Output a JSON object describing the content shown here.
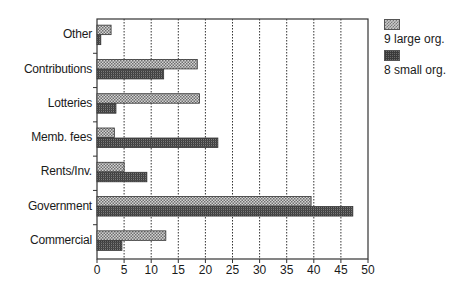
{
  "chart_data": {
    "type": "bar",
    "orientation": "horizontal",
    "title": "",
    "xlabel": "",
    "ylabel": "",
    "xlim": [
      0,
      50
    ],
    "xticks": [
      0,
      5,
      10,
      15,
      20,
      25,
      30,
      35,
      40,
      45,
      50
    ],
    "grid": "vertical dotted",
    "legend_position": "right",
    "categories": [
      "Other",
      "Contributions",
      "Lotteries",
      "Memb. fees",
      "Rents/Inv.",
      "Government",
      "Commercial"
    ],
    "series": [
      {
        "name": "9 large org.",
        "pattern": "checkered-light",
        "values": [
          2.6,
          18.5,
          18.9,
          3.2,
          5.0,
          39.5,
          12.7
        ]
      },
      {
        "name": "8 small org.",
        "pattern": "grid-dark",
        "values": [
          0.7,
          12.3,
          3.5,
          22.3,
          9.2,
          47.2,
          4.6
        ]
      }
    ]
  },
  "legend": {
    "items": [
      {
        "label": "9 large org."
      },
      {
        "label": "8 small org."
      }
    ]
  }
}
